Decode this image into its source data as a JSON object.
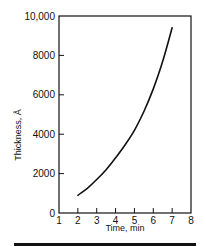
{
  "chart_data": {
    "type": "line",
    "title": "",
    "xlabel": "Time, min",
    "ylabel": "Thickness, Å",
    "xlim": [
      1,
      8
    ],
    "ylim": [
      0,
      10000
    ],
    "x_ticks": [
      1,
      2,
      3,
      4,
      5,
      6,
      7,
      8
    ],
    "x_tick_labels": [
      "1",
      "2",
      "3",
      "4",
      "5",
      "6",
      "7",
      "8"
    ],
    "y_ticks": [
      0,
      2000,
      4000,
      6000,
      8000,
      10000
    ],
    "y_tick_labels": [
      "0",
      "2000",
      "4000",
      "6000",
      "8000",
      "10,000"
    ],
    "grid": false,
    "legend": null,
    "series": [
      {
        "name": "Thickness",
        "x": [
          2,
          2.5,
          3,
          3.5,
          4,
          4.5,
          5,
          5.5,
          6,
          6.5,
          7
        ],
        "y": [
          900,
          1250,
          1700,
          2200,
          2800,
          3450,
          4200,
          5150,
          6300,
          7700,
          9400
        ]
      }
    ],
    "frame": "box"
  }
}
